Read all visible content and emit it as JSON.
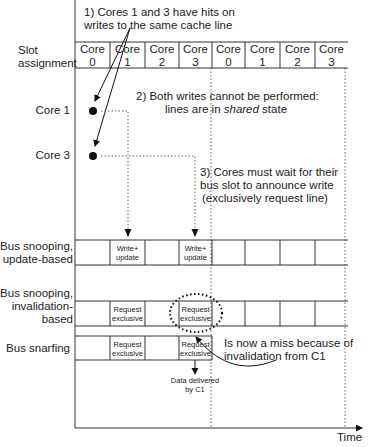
{
  "row_labels": {
    "slot_assignment": "Slot\nassignment",
    "slot_line1": "Slot",
    "slot_line2": "assignment",
    "core1": "Core 1",
    "core3": "Core 3",
    "update_line1": "Bus snooping,",
    "update_line2": "update-based",
    "inval_line1": "Bus snooping,",
    "inval_line2": "invalidation-",
    "inval_line3": "based",
    "snarf": "Bus snarfing",
    "time": "Time"
  },
  "slots": [
    {
      "l1": "Core",
      "l2": "0"
    },
    {
      "l1": "Core",
      "l2": "1"
    },
    {
      "l1": "Core",
      "l2": "2"
    },
    {
      "l1": "Core",
      "l2": "3"
    },
    {
      "l1": "Core",
      "l2": "0"
    },
    {
      "l1": "Core",
      "l2": "1"
    },
    {
      "l1": "Core",
      "l2": "2"
    },
    {
      "l1": "Core",
      "l2": "3"
    }
  ],
  "notes": {
    "n1_line1": "1) Cores 1 and 3 have hits on",
    "n1_line2": "writes to the same cache line",
    "n2_line1": "2) Both writes cannot be performed:",
    "n2_line2_a": "lines are in ",
    "n2_line2_em": "shared",
    "n2_line2_b": " state",
    "n3_line1": "3) Cores must wait for their",
    "n3_line2": "bus slot to announce write",
    "n3_line3": "(exclusively request line)",
    "miss_line1": "Is now a miss because of",
    "miss_line2": "invalidation from C1",
    "data_line1": "Data delivered",
    "data_line2": "by C1"
  },
  "update_row": {
    "cells": [
      {
        "slot": 1,
        "l1": "Write+",
        "l2": "update"
      },
      {
        "slot": 3,
        "l1": "Write+",
        "l2": "update"
      }
    ]
  },
  "inval_row": {
    "cells": [
      {
        "slot": 1,
        "l1": "Request",
        "l2": "exclusive"
      },
      {
        "slot": 3,
        "l1": "Request",
        "l2": "exclusive"
      }
    ]
  },
  "snarf_row": {
    "cells": [
      {
        "slot": 1,
        "l1": "Request",
        "l2": "exclusive"
      },
      {
        "slot": 3,
        "l1": "Request",
        "l2": "exclusive"
      }
    ]
  }
}
